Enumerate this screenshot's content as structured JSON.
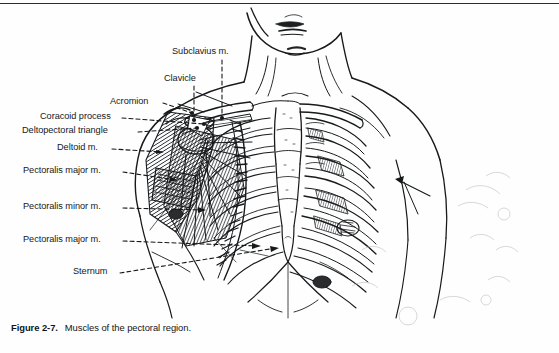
{
  "page": {
    "width": 559,
    "height": 353,
    "background_color": "#fefefe",
    "ink_color": "#16181a",
    "rule_color": "#2b2b2b"
  },
  "caption": {
    "number": "Figure 2-7.",
    "text": "Muscles of the pectoral region."
  },
  "figure": {
    "title": "Muscles of the pectoral region",
    "style": "black and white line drawing, scanned textbook page"
  },
  "labels": [
    {
      "id": "subclavius",
      "text": "Subclavius m.",
      "x": 172,
      "y": 51,
      "align": "left",
      "leader": "vertical-dashed-down"
    },
    {
      "id": "clavicle",
      "text": "Clavicle",
      "x": 164,
      "y": 78,
      "align": "left",
      "leader": "vertical-dashed-down"
    },
    {
      "id": "acromion",
      "text": "Acromion",
      "x": 115,
      "y": 100,
      "align": "left",
      "leader": "dashed-right"
    },
    {
      "id": "coracoid-process",
      "text": "Coracoid process",
      "x": 40,
      "y": 115,
      "align": "left",
      "leader": "dashed-right"
    },
    {
      "id": "deltopectoral-triangle",
      "text": "Deltopectoral triangle",
      "x": 22,
      "y": 129,
      "align": "left",
      "leader": "dashed-right"
    },
    {
      "id": "deltoid",
      "text": "Deltoid m.",
      "x": 62,
      "y": 146,
      "align": "left",
      "leader": "dashed-right-arrow"
    },
    {
      "id": "pectoralis-major-upper",
      "text": "Pectoralis major m.",
      "x": 23,
      "y": 169,
      "align": "left",
      "leader": "dashed-right-arrow"
    },
    {
      "id": "pectoralis-minor",
      "text": "Pectoralis minor m.",
      "x": 23,
      "y": 205,
      "align": "left",
      "leader": "dashed-right-arrow"
    },
    {
      "id": "pectoralis-major-lower",
      "text": "Pectoralis major m.",
      "x": 23,
      "y": 238,
      "align": "left",
      "leader": "dashed-right-arrow"
    },
    {
      "id": "sternum",
      "text": "Sternum",
      "x": 73,
      "y": 270,
      "align": "left",
      "leader": "dashed-right-arrow"
    }
  ]
}
